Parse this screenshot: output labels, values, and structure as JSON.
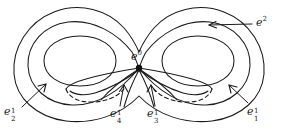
{
  "figure": {
    "background_color": "#ffffff",
    "ink_color": "#1a1a1a",
    "labels": {
      "zero_cell": {
        "base": "e",
        "sup": "0",
        "sub": ""
      },
      "two_cell": {
        "base": "e",
        "sup": "2",
        "sub": ""
      },
      "one_cell_1": {
        "base": "e",
        "sup": "1",
        "sub": "1"
      },
      "one_cell_2": {
        "base": "e",
        "sup": "1",
        "sub": "2"
      },
      "one_cell_3": {
        "base": "e",
        "sup": "1",
        "sub": "3"
      },
      "one_cell_4": {
        "base": "e",
        "sup": "1",
        "sub": "4"
      }
    },
    "vertex": {
      "x": 139,
      "y": 68,
      "radius": 3.2
    },
    "curves": {
      "outer_boundary": "M 139 96 C 120 116, 92 124, 66 121 C 36 117, 16 98, 14 74 C 12 48, 28 22, 54 12 C 80 2, 108 10, 124 28 C 131 36, 136 45, 139 52 C 142 45, 147 36, 154 28 C 170 10, 198 2, 224 12 C 250 22, 266 48, 264 74 C 262 98, 242 117, 212 121 C 186 124, 158 116, 139 96 Z",
      "left_middle_loop": "M 139 68 C 120 92, 96 106, 72 105 C 47 104, 29 87, 28 66 C 27 44, 44 25, 68 22 C 94 19, 118 34, 132 52 C 135 57, 137 63, 139 68 Z",
      "right_middle_loop": "M 139 68 C 158 92, 182 106, 206 105 C 231 104, 249 87, 250 66 C 251 44, 234 25, 210 22 C 184 19, 160 34, 146 52 C 143 57, 141 63, 139 68 Z",
      "left_inner_oval": "M 44 61 C 44 46, 60 36, 80 36 C 100 36, 116 46, 116 61 C 116 76, 100 86, 80 86 C 60 86, 44 76, 44 61 Z",
      "right_inner_oval": "M 162 61 C 162 46, 178 36, 198 36 C 218 36, 234 46, 234 61 C 234 76, 218 86, 198 86 C 178 86, 162 76, 162 61 Z",
      "left_thin_lobe_upper": "M 139 68 C 122 74, 104 78, 90 80 C 78 82, 70 84, 68 88",
      "left_thin_lobe_lower": "M 139 70 C 124 82, 108 90, 96 93 C 86 96, 78 95, 74 92",
      "right_thin_lobe_upper": "M 139 68 C 156 74, 174 78, 188 80 C 200 82, 208 84, 210 88",
      "right_thin_lobe_lower": "M 139 70 C 154 82, 170 90, 182 93 C 192 96, 200 95, 204 92",
      "left_dashed_arc": "M 68 88 C 70 96, 80 101, 94 100 C 106 99, 116 94, 122 88",
      "right_dashed_arc": "M 210 88 C 208 96, 198 101, 184 100 C 172 99, 162 94, 156 88",
      "left_spoke_down": "M 139 70 C 132 80, 126 90, 120 104",
      "right_spoke_down": "M 139 70 C 146 80, 152 90, 158 104",
      "left_spoke_outer": "M 139 69 C 126 76, 110 84, 96 95",
      "right_spoke_outer": "M 139 69 C 152 76, 168 84, 182 95"
    },
    "arrows": [
      {
        "name": "arrow-e2",
        "from_x": 252,
        "from_y": 24,
        "to_x": 206,
        "to_y": 25
      },
      {
        "name": "arrow-e1-1",
        "from_x": 248,
        "from_y": 104,
        "to_x": 228,
        "to_y": 84
      },
      {
        "name": "arrow-e2-1",
        "from_x": 21,
        "from_y": 107,
        "to_x": 46,
        "to_y": 83
      },
      {
        "name": "arrow-e3-1",
        "from_x": 155,
        "from_y": 106,
        "to_x": 150,
        "to_y": 84
      },
      {
        "name": "arrow-e4-1",
        "from_x": 120,
        "from_y": 106,
        "to_x": 125,
        "to_y": 84
      }
    ]
  }
}
